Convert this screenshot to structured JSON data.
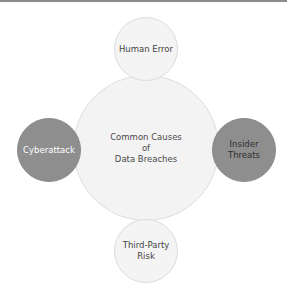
{
  "diagram": {
    "type": "hub-and-spoke",
    "center": {
      "label": "Common Causes\nof\nData Breaches"
    },
    "nodes": [
      {
        "position": "top",
        "label": "Human Error",
        "style": "light"
      },
      {
        "position": "left",
        "label": "Cyberattack",
        "style": "dark"
      },
      {
        "position": "right",
        "label": "Insider\nThreats",
        "style": "dark"
      },
      {
        "position": "bottom",
        "label": "Third-Party\nRisk",
        "style": "light"
      }
    ],
    "colors": {
      "center_fill": "#f3f3f3",
      "light_fill": "#f4f4f4",
      "dark_fill": "#8e8e8e",
      "border": "#dedede"
    }
  }
}
